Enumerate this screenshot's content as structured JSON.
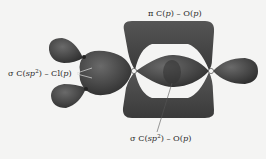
{
  "diagram": {
    "atoms": [
      {
        "symbol": "C",
        "role": "carbonyl carbon"
      },
      {
        "symbol": "O",
        "role": "carbonyl oxygen"
      },
      {
        "symbol": "Cl",
        "role": "chlorine (upper)"
      },
      {
        "symbol": "Cl",
        "role": "chlorine (lower)"
      }
    ],
    "labels": {
      "pi_bond": {
        "symbol": "π",
        "text": "C(",
        "orb1": "p",
        "mid": ") – O(",
        "orb2": "p",
        "end": ")"
      },
      "sigma_c_cl": {
        "symbol": "σ",
        "text": "C(",
        "orb1": "sp",
        "sup": "2",
        "mid": ") – Cl(",
        "orb2": "p",
        "end": ")"
      },
      "sigma_c_o": {
        "symbol": "σ",
        "text": "C(",
        "orb1": "sp",
        "sup": "2",
        "mid": ") – O(",
        "orb2": "p",
        "end": ")"
      }
    },
    "colors": {
      "orbital_fill": "#4a4a4a",
      "orbital_dark": "#2e2e2e",
      "background": "#f4f4f3",
      "text": "#2a2a2a"
    }
  }
}
